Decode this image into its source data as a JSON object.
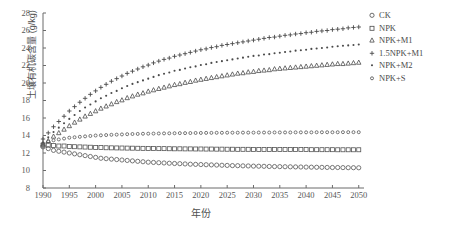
{
  "chart_data": {
    "type": "scatter",
    "title": "",
    "xlabel": "年份",
    "ylabel": "土壤有机碳含量 (g/kg)",
    "xlim": [
      1990,
      2051
    ],
    "ylim": [
      8,
      28
    ],
    "xticks": [
      1990,
      1995,
      2000,
      2005,
      2010,
      2015,
      2020,
      2025,
      2030,
      2035,
      2040,
      2045,
      2050
    ],
    "yticks": [
      8,
      10,
      12,
      14,
      16,
      18,
      20,
      22,
      24,
      26,
      28
    ],
    "grid": false,
    "legend_position": "right",
    "x": [
      1990,
      1991,
      1992,
      1993,
      1994,
      1995,
      1996,
      1997,
      1998,
      1999,
      2000,
      2001,
      2002,
      2003,
      2004,
      2005,
      2006,
      2007,
      2008,
      2009,
      2010,
      2011,
      2012,
      2013,
      2014,
      2015,
      2016,
      2017,
      2018,
      2019,
      2020,
      2021,
      2022,
      2023,
      2024,
      2025,
      2026,
      2027,
      2028,
      2029,
      2030,
      2031,
      2032,
      2033,
      2034,
      2035,
      2036,
      2037,
      2038,
      2039,
      2040,
      2041,
      2042,
      2043,
      2044,
      2045,
      2046,
      2047,
      2048,
      2049,
      2050
    ],
    "series": [
      {
        "name": "CK",
        "marker": "open-circle",
        "color": "#555555",
        "values": [
          12.7,
          12.5,
          12.3,
          12.2,
          12.1,
          12.0,
          11.9,
          11.8,
          11.7,
          11.6,
          11.5,
          11.4,
          11.35,
          11.3,
          11.25,
          11.2,
          11.15,
          11.1,
          11.05,
          11.0,
          10.95,
          10.92,
          10.89,
          10.86,
          10.83,
          10.8,
          10.78,
          10.75,
          10.72,
          10.7,
          10.68,
          10.66,
          10.64,
          10.62,
          10.6,
          10.58,
          10.56,
          10.55,
          10.53,
          10.52,
          10.5,
          10.49,
          10.48,
          10.46,
          10.45,
          10.44,
          10.43,
          10.42,
          10.41,
          10.4,
          10.39,
          10.38,
          10.37,
          10.36,
          10.35,
          10.34,
          10.34,
          10.33,
          10.32,
          10.32,
          10.31
        ]
      },
      {
        "name": "NPK",
        "marker": "open-square",
        "color": "#555555",
        "values": [
          12.9,
          12.9,
          12.85,
          12.8,
          12.8,
          12.75,
          12.72,
          12.7,
          12.68,
          12.66,
          12.64,
          12.62,
          12.6,
          12.59,
          12.58,
          12.57,
          12.56,
          12.55,
          12.54,
          12.53,
          12.52,
          12.51,
          12.5,
          12.5,
          12.49,
          12.48,
          12.48,
          12.47,
          12.47,
          12.46,
          12.46,
          12.45,
          12.45,
          12.44,
          12.44,
          12.43,
          12.43,
          12.42,
          12.42,
          12.42,
          12.41,
          12.41,
          12.41,
          12.4,
          12.4,
          12.4,
          12.4,
          12.39,
          12.39,
          12.39,
          12.39,
          12.38,
          12.38,
          12.38,
          12.38,
          12.38,
          12.37,
          12.37,
          12.37,
          12.37,
          12.37
        ]
      },
      {
        "name": "NPK+M1",
        "marker": "open-triangle",
        "color": "#4a4a4a",
        "values": [
          13.0,
          13.4,
          13.9,
          14.3,
          14.7,
          15.1,
          15.5,
          15.85,
          16.2,
          16.5,
          16.8,
          17.1,
          17.35,
          17.6,
          17.85,
          18.05,
          18.3,
          18.5,
          18.7,
          18.85,
          19.05,
          19.2,
          19.35,
          19.5,
          19.65,
          19.8,
          19.9,
          20.05,
          20.15,
          20.3,
          20.4,
          20.5,
          20.6,
          20.7,
          20.8,
          20.9,
          21.0,
          21.1,
          21.15,
          21.25,
          21.3,
          21.4,
          21.45,
          21.5,
          21.6,
          21.65,
          21.7,
          21.75,
          21.8,
          21.85,
          21.9,
          21.95,
          22.0,
          22.05,
          22.1,
          22.15,
          22.2,
          22.2,
          22.25,
          22.3,
          22.35
        ]
      },
      {
        "name": "1.5NPK+M1",
        "marker": "plus",
        "color": "#4a4a4a",
        "values": [
          13.6,
          14.3,
          15.0,
          15.6,
          16.2,
          16.8,
          17.3,
          17.8,
          18.25,
          18.7,
          19.1,
          19.5,
          19.85,
          20.2,
          20.5,
          20.8,
          21.1,
          21.35,
          21.6,
          21.85,
          22.05,
          22.3,
          22.5,
          22.7,
          22.85,
          23.05,
          23.2,
          23.35,
          23.5,
          23.65,
          23.8,
          23.9,
          24.05,
          24.15,
          24.3,
          24.4,
          24.5,
          24.6,
          24.7,
          24.8,
          24.9,
          25.0,
          25.1,
          25.2,
          25.25,
          25.35,
          25.45,
          25.5,
          25.6,
          25.65,
          25.75,
          25.8,
          25.9,
          25.95,
          26.0,
          26.1,
          26.15,
          26.2,
          26.3,
          26.35,
          26.4
        ]
      },
      {
        "name": "NPK+M2",
        "marker": "dot",
        "color": "#4a4a4a",
        "values": [
          13.2,
          13.8,
          14.4,
          14.9,
          15.4,
          15.9,
          16.35,
          16.8,
          17.2,
          17.55,
          17.9,
          18.25,
          18.55,
          18.85,
          19.1,
          19.4,
          19.65,
          19.9,
          20.1,
          20.3,
          20.5,
          20.7,
          20.9,
          21.05,
          21.2,
          21.4,
          21.5,
          21.65,
          21.8,
          21.9,
          22.05,
          22.15,
          22.3,
          22.4,
          22.5,
          22.6,
          22.7,
          22.8,
          22.9,
          23.0,
          23.1,
          23.15,
          23.25,
          23.3,
          23.4,
          23.45,
          23.55,
          23.6,
          23.7,
          23.75,
          23.8,
          23.9,
          23.95,
          24.0,
          24.05,
          24.15,
          24.2,
          24.25,
          24.3,
          24.35,
          24.4
        ]
      },
      {
        "name": "NPK+S",
        "marker": "small-circle",
        "color": "#555555",
        "values": [
          13.1,
          13.3,
          13.45,
          13.55,
          13.65,
          13.75,
          13.8,
          13.85,
          13.9,
          13.95,
          14.0,
          14.02,
          14.05,
          14.08,
          14.1,
          14.12,
          14.15,
          14.17,
          14.18,
          14.2,
          14.21,
          14.22,
          14.23,
          14.24,
          14.25,
          14.26,
          14.27,
          14.27,
          14.28,
          14.29,
          14.29,
          14.3,
          14.3,
          14.31,
          14.31,
          14.32,
          14.32,
          14.32,
          14.33,
          14.33,
          14.33,
          14.34,
          14.34,
          14.34,
          14.35,
          14.35,
          14.35,
          14.35,
          14.36,
          14.36,
          14.36,
          14.36,
          14.37,
          14.37,
          14.37,
          14.37,
          14.37,
          14.38,
          14.38,
          14.38,
          14.38
        ]
      }
    ]
  },
  "legend": {
    "items": [
      {
        "label": "CK",
        "marker": "open-circle"
      },
      {
        "label": "NPK",
        "marker": "open-square"
      },
      {
        "label": "NPK+M1",
        "marker": "open-triangle"
      },
      {
        "label": "1.5NPK+M1",
        "marker": "plus"
      },
      {
        "label": "NPK+M2",
        "marker": "dot"
      },
      {
        "label": "NPK+S",
        "marker": "small-circle"
      }
    ]
  }
}
